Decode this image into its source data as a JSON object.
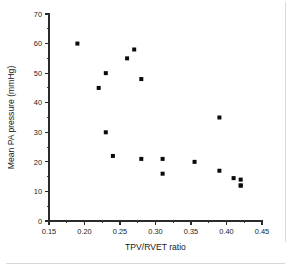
{
  "chart_data": {
    "type": "scatter",
    "title": "",
    "xlabel": "TPV/RVET ratio",
    "ylabel": "Mean PA pressure (mmHg)",
    "xlim": [
      0.15,
      0.45
    ],
    "ylim": [
      0,
      70
    ],
    "grid": false,
    "legend": null,
    "marker": {
      "shape": "square",
      "color": "#0a0a0a",
      "size": 4
    },
    "x_ticks_major": [
      0.15,
      0.2,
      0.25,
      0.3,
      0.35,
      0.4,
      0.45
    ],
    "x_ticklabels": [
      "0.15",
      "0.20",
      "0.25",
      "0.30",
      "0.35",
      "0.40",
      "0.45"
    ],
    "x_ticks_minor": [
      0.175,
      0.225,
      0.275,
      0.325,
      0.375,
      0.425
    ],
    "y_ticks_major": [
      0,
      10,
      20,
      30,
      40,
      50,
      60,
      70
    ],
    "y_ticklabels": [
      "0",
      "10",
      "20",
      "30",
      "40",
      "50",
      "60",
      "70"
    ],
    "y_ticks_minor": [
      5,
      15,
      25,
      35,
      45,
      55,
      65
    ],
    "n_points": 18,
    "x": [
      0.19,
      0.22,
      0.23,
      0.23,
      0.24,
      0.26,
      0.27,
      0.28,
      0.28,
      0.31,
      0.31,
      0.355,
      0.39,
      0.39,
      0.41,
      0.42,
      0.42,
      0.42
    ],
    "y": [
      60,
      45,
      50,
      30,
      22,
      55,
      58,
      48,
      21,
      21,
      16,
      20,
      35,
      17,
      14.5,
      14,
      12,
      12
    ],
    "points": [
      {
        "x": 0.19,
        "y": 60
      },
      {
        "x": 0.22,
        "y": 45
      },
      {
        "x": 0.23,
        "y": 50
      },
      {
        "x": 0.23,
        "y": 30
      },
      {
        "x": 0.24,
        "y": 22
      },
      {
        "x": 0.26,
        "y": 55
      },
      {
        "x": 0.27,
        "y": 58
      },
      {
        "x": 0.28,
        "y": 48
      },
      {
        "x": 0.28,
        "y": 21
      },
      {
        "x": 0.31,
        "y": 21
      },
      {
        "x": 0.31,
        "y": 16
      },
      {
        "x": 0.355,
        "y": 20
      },
      {
        "x": 0.39,
        "y": 35
      },
      {
        "x": 0.39,
        "y": 17
      },
      {
        "x": 0.41,
        "y": 14.5
      },
      {
        "x": 0.42,
        "y": 14
      },
      {
        "x": 0.42,
        "y": 12
      },
      {
        "x": 0.42,
        "y": 12
      }
    ]
  }
}
